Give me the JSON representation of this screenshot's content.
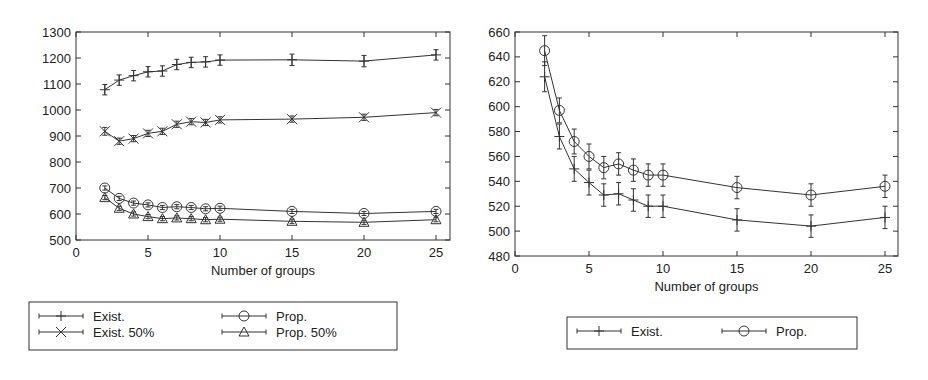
{
  "chart_data": [
    {
      "type": "line",
      "title": "",
      "xlabel": "Number of groups",
      "ylabel": "",
      "x": [
        2,
        3,
        4,
        5,
        6,
        7,
        8,
        9,
        10,
        15,
        20,
        25
      ],
      "xlim": [
        0,
        26
      ],
      "ylim": [
        500,
        1300
      ],
      "xticks": [
        "0",
        "5",
        "10",
        "15",
        "20",
        "25"
      ],
      "yticks": [
        "500",
        "600",
        "700",
        "800",
        "900",
        "1000",
        "1100",
        "1200",
        "1300"
      ],
      "grid": false,
      "error_bars": true,
      "legend_position": "below",
      "series": [
        {
          "name": "Exist.",
          "marker": "plus",
          "values": [
            1078,
            1115,
            1132,
            1147,
            1150,
            1175,
            1183,
            1185,
            1192,
            1193,
            1188,
            1212
          ],
          "err": [
            20,
            20,
            20,
            20,
            20,
            20,
            20,
            20,
            20,
            22,
            22,
            20
          ]
        },
        {
          "name": "Exist. 50%",
          "marker": "x",
          "values": [
            918,
            880,
            890,
            910,
            918,
            945,
            955,
            952,
            962,
            965,
            972,
            990
          ],
          "err": [
            15,
            12,
            12,
            12,
            12,
            12,
            12,
            12,
            12,
            12,
            12,
            12
          ]
        },
        {
          "name": "Prop.",
          "marker": "circle",
          "values": [
            700,
            660,
            642,
            635,
            625,
            628,
            625,
            620,
            622,
            610,
            602,
            610
          ],
          "err": [
            8,
            8,
            8,
            8,
            8,
            8,
            8,
            8,
            8,
            8,
            8,
            8
          ]
        },
        {
          "name": "Prop. 50%",
          "marker": "triangle",
          "values": [
            663,
            622,
            600,
            590,
            582,
            585,
            582,
            578,
            580,
            572,
            568,
            578
          ],
          "err": [
            8,
            8,
            8,
            8,
            8,
            8,
            8,
            8,
            8,
            8,
            8,
            8
          ]
        }
      ]
    },
    {
      "type": "line",
      "title": "",
      "xlabel": "Number of groups",
      "ylabel": "",
      "x": [
        2,
        3,
        4,
        5,
        6,
        7,
        8,
        9,
        10,
        15,
        20,
        25
      ],
      "xlim": [
        0,
        26
      ],
      "ylim": [
        480,
        660
      ],
      "xticks": [
        "0",
        "5",
        "10",
        "15",
        "20",
        "25"
      ],
      "yticks": [
        "480",
        "500",
        "520",
        "540",
        "560",
        "580",
        "600",
        "620",
        "640",
        "660"
      ],
      "grid": false,
      "error_bars": true,
      "legend_position": "below",
      "series": [
        {
          "name": "Exist.",
          "marker": "plus",
          "values": [
            624,
            576,
            550,
            539,
            529,
            530,
            525,
            520,
            520,
            509,
            504,
            511
          ],
          "err": [
            12,
            10,
            10,
            10,
            9,
            9,
            9,
            9,
            9,
            9,
            9,
            9
          ]
        },
        {
          "name": "Prop.",
          "marker": "circle",
          "values": [
            645,
            597,
            572,
            560,
            551,
            554,
            549,
            545,
            545,
            535,
            529,
            536
          ],
          "err": [
            12,
            10,
            10,
            10,
            9,
            9,
            9,
            9,
            9,
            9,
            9,
            9
          ]
        }
      ]
    }
  ],
  "charts": [
    {
      "xlabel": "Number of groups",
      "legend": [
        "Exist.",
        "Exist. 50%",
        "Prop.",
        "Prop. 50%"
      ]
    },
    {
      "xlabel": "Number of groups",
      "legend": [
        "Exist.",
        "Prop."
      ]
    }
  ]
}
